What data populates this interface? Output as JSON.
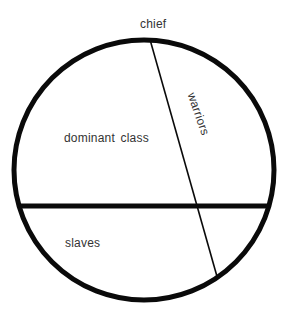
{
  "diagram": {
    "type": "circle-segment-diagram",
    "title": "",
    "background_color": "#ffffff",
    "stroke_color": "#000000",
    "text_color": "#333333",
    "circle": {
      "center_x": 144,
      "center_y": 170,
      "radius": 130,
      "stroke_width": 5
    },
    "dividers": [
      {
        "name": "horizontal-divider",
        "kind": "chord",
        "x1": 15,
        "y1": 206,
        "x2": 273,
        "y2": 206,
        "stroke_width": 5
      },
      {
        "name": "warriors-divider",
        "kind": "chord",
        "x1": 149,
        "y1": 40,
        "x2": 218,
        "y2": 278,
        "stroke_width": 1.6
      }
    ],
    "labels": [
      {
        "id": "chief",
        "text": "chief",
        "x": 140,
        "y": 18,
        "rotation": 0,
        "position": "above-circle-top"
      },
      {
        "id": "warriors",
        "text": "warriors",
        "x": 198,
        "y": 114,
        "rotation": 71,
        "position": "right-wedge"
      },
      {
        "id": "dominant_class",
        "text": "dominant class",
        "x": 64,
        "y": 132,
        "rotation": 0,
        "position": "upper-left-segment"
      },
      {
        "id": "slaves",
        "text": "slaves",
        "x": 65,
        "y": 237,
        "rotation": 0,
        "position": "lower-left-segment"
      }
    ]
  }
}
